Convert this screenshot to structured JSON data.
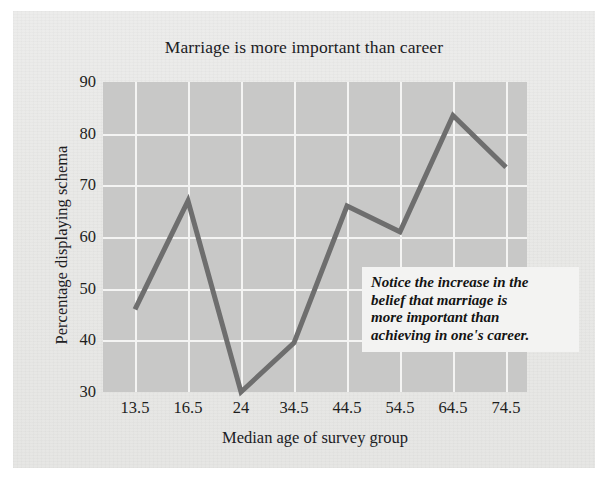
{
  "chart_data": {
    "type": "line",
    "title": "Marriage is more important than career",
    "xlabel": "Median age of survey group",
    "ylabel": "Percentage displaying schema",
    "categories": [
      "13.5",
      "16.5",
      "24",
      "34.5",
      "44.5",
      "54.5",
      "64.5",
      "74.5"
    ],
    "values": [
      46,
      67,
      30,
      39.5,
      66,
      61,
      83.5,
      73.5
    ],
    "ylim": [
      30,
      90
    ],
    "yticks": [
      "30",
      "40",
      "50",
      "60",
      "70",
      "80",
      "90"
    ],
    "xticks": [
      "13.5",
      "16.5",
      "24",
      "34.5",
      "44.5",
      "54.5",
      "64.5",
      "74.5"
    ],
    "grid": true,
    "legend": "none",
    "series": [
      {
        "name": "Percentage displaying schema",
        "values": [
          46,
          67,
          30,
          39.5,
          66,
          61,
          83.5,
          73.5
        ]
      }
    ],
    "annotations": [
      {
        "id": "notice-callout",
        "lines": [
          "Notice the increase in the",
          "belief that marriage is",
          "more important than",
          "achieving in one's career."
        ]
      }
    ],
    "colors": {
      "line": "#6e6e6e",
      "plot_background": "#c8c8c7",
      "gridline": "#f4f4f3",
      "page_background": "#e9e9e7",
      "text": "#1e1e1d",
      "annotation_background": "#f3f3f2"
    }
  }
}
